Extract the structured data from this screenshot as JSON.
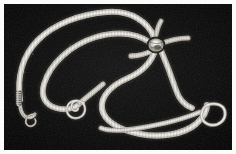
{
  "figure": {
    "caption": "",
    "kind": "grayscale-photomicrograph",
    "specimen_count": 3,
    "background_color": "#050505",
    "border_color": "#fbfbf9",
    "body_highlight_color": "#e8e6e0",
    "body_midtone_color": "#9a978f",
    "body_shadow_color": "#3a3834",
    "width_px": 236,
    "height_px": 154,
    "plate_inset_px": 4
  },
  "features": [
    {
      "id": "scolex-knot",
      "label": "central crossing knot",
      "x": 152,
      "y": 40
    },
    {
      "id": "spiral-tail",
      "label": "tightly coiled male tail",
      "x": 75,
      "y": 106
    },
    {
      "id": "right-loop",
      "label": "open loop of posterior end",
      "x": 212,
      "y": 102
    },
    {
      "id": "left-hook-loop",
      "label": "small hooked terminal loop",
      "x": 20,
      "y": 115
    },
    {
      "id": "left-striated-end",
      "label": "striated anterior end",
      "x": 14,
      "y": 98
    },
    {
      "id": "top-arch",
      "label": "upper sweeping arch",
      "x": 112,
      "y": 15
    },
    {
      "id": "bottom-strand",
      "label": "lower long strand",
      "x": 140,
      "y": 132
    }
  ],
  "accessibility": {
    "alt": "Black and white photomicrograph showing three long slender nematode worms arranged in overlapping curves on a dark background, with a tight spiral coil at lower left, a crossing knot near the upper centre, and an open loop at the right."
  }
}
